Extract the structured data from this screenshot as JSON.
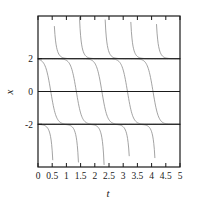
{
  "chart_data": {
    "type": "line",
    "title": "",
    "subtitle": "",
    "xlabel": "t",
    "ylabel": "x",
    "xlim": [
      0,
      5
    ],
    "ylim": [
      -4.6,
      4.6
    ],
    "grid": false,
    "legend": null,
    "legend_position": "none",
    "xticks": [
      0,
      0.5,
      1,
      1.5,
      2,
      2.5,
      3,
      3.5,
      4,
      4.5,
      5
    ],
    "xticklabels": [
      "0",
      "0.5",
      "1",
      "1.5",
      "2",
      "2.5",
      "3",
      "3.5",
      "4",
      "4.5",
      "5"
    ],
    "yticks": [
      2,
      0,
      -2
    ],
    "yticklabels": [
      "2",
      "0",
      "-2"
    ],
    "equilibria": [
      {
        "value": 2,
        "label": "2",
        "kind": "stable"
      },
      {
        "value": -2,
        "label": "-2",
        "kind": "unstable"
      }
    ],
    "reference_lines": [
      {
        "y": 2,
        "style": "solid"
      },
      {
        "y": 0,
        "style": "solid"
      },
      {
        "y": -2,
        "style": "solid"
      }
    ],
    "curve_color": "#8c8c8c",
    "axis_color": "#1a1a1a",
    "background_color": "#ffffff",
    "model": "dx/dt = k(4 - x^2)",
    "growth_rate": 2.6,
    "series": [
      {
        "name": "above-asymptote-1",
        "branch": "upper",
        "t_blowup": 0.47
      },
      {
        "name": "above-asymptote-2",
        "branch": "upper",
        "t_blowup": 1.37
      },
      {
        "name": "above-asymptote-3",
        "branch": "upper",
        "t_blowup": 2.27
      },
      {
        "name": "above-asymptote-4",
        "branch": "upper",
        "t_blowup": 3.17
      },
      {
        "name": "above-asymptote-5",
        "branch": "upper",
        "t_blowup": 4.07
      },
      {
        "name": "sigmoid-1",
        "branch": "middle",
        "t_midpoint": 0.45
      },
      {
        "name": "sigmoid-2",
        "branch": "middle",
        "t_midpoint": 1.35
      },
      {
        "name": "sigmoid-3",
        "branch": "middle",
        "t_midpoint": 2.25
      },
      {
        "name": "sigmoid-4",
        "branch": "middle",
        "t_midpoint": 3.15
      },
      {
        "name": "sigmoid-5",
        "branch": "middle",
        "t_midpoint": 4.05
      },
      {
        "name": "below-asymptote-1",
        "branch": "lower",
        "t_blowup": 0.62
      },
      {
        "name": "below-asymptote-2",
        "branch": "lower",
        "t_blowup": 1.52
      },
      {
        "name": "below-asymptote-3",
        "branch": "lower",
        "t_blowup": 2.42
      },
      {
        "name": "below-asymptote-4",
        "branch": "lower",
        "t_blowup": 3.32
      },
      {
        "name": "below-asymptote-5",
        "branch": "lower",
        "t_blowup": 4.22
      }
    ]
  },
  "labels": {
    "xaxis": "t",
    "yaxis": "x"
  }
}
